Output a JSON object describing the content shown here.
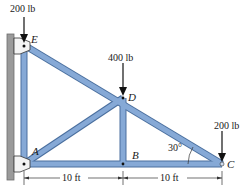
{
  "diagram": {
    "type": "truss",
    "colors": {
      "member_fill": "#86a9d6",
      "member_edge": "#4a6f9e",
      "wall": "#9a9a9a",
      "arrow": "#111111",
      "text": "#1a1a1a"
    },
    "joints": [
      {
        "id": "E",
        "label": "E"
      },
      {
        "id": "D",
        "label": "D"
      },
      {
        "id": "A",
        "label": "A"
      },
      {
        "id": "B",
        "label": "B"
      },
      {
        "id": "C",
        "label": "C"
      }
    ],
    "members": [
      "EA",
      "ED",
      "DC",
      "AD",
      "DB",
      "AB",
      "BC"
    ],
    "loads": [
      {
        "joint": "E",
        "label": "200 lb"
      },
      {
        "joint": "D",
        "label": "400 lb"
      },
      {
        "joint": "C",
        "label": "200 lb"
      }
    ],
    "angle": {
      "label": "30°",
      "at": "C"
    },
    "dimensions": [
      {
        "label": "10 ft",
        "from": "A",
        "to": "B"
      },
      {
        "label": "10 ft",
        "from": "B",
        "to": "C"
      }
    ]
  }
}
